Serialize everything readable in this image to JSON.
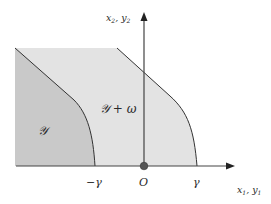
{
  "diagram": {
    "axes": {
      "y_label_a": "x",
      "y_label_a_sub": "2",
      "y_label_sep": ", ",
      "y_label_b": "y",
      "y_label_b_sub": "2",
      "x_label_a": "x",
      "x_label_a_sub": "1",
      "x_label_sep": ", ",
      "x_label_b": "y",
      "x_label_b_sub": "1"
    },
    "ticks": {
      "neg_gamma": "−γ",
      "origin": "O",
      "gamma": "γ"
    },
    "regions": {
      "inner": "𝒴",
      "outer": "𝒴 + ω"
    },
    "colors": {
      "inner_fill": "#c9c9c9",
      "outer_fill": "#e3e3e3",
      "line": "#333333",
      "origin_dot": "#555555"
    }
  }
}
